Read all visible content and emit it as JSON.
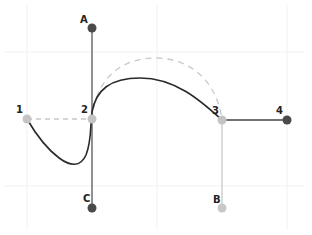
{
  "diagram": {
    "colors": {
      "curve": "#2a2a2a",
      "anchor_point": "#c4c4c4",
      "handle_dark": "#4a4a4a",
      "handle_light": "#c8c8c8",
      "dashed_guide": "#c8c8c8",
      "grid": "#f2f2f2"
    },
    "anchor_labels": [
      "1",
      "2",
      "3",
      "4"
    ],
    "handle_labels": [
      "A",
      "B",
      "C"
    ],
    "labels": {
      "p1": "1",
      "p2": "2",
      "p3": "3",
      "p4": "4",
      "hA": "A",
      "hB": "B",
      "hC": "C"
    }
  }
}
